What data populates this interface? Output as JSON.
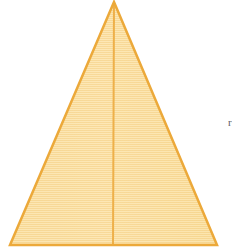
{
  "figure": {
    "background_color": "#ffffff",
    "canvas": {
      "width": 234,
      "height": 247
    },
    "shape": {
      "name": "triangle",
      "kind": "isosceles",
      "fill_color": "#fadf9f",
      "fill_color_light": "#fde9bb",
      "stroke_color": "#eca93a",
      "stroke_width": 2.5,
      "vertices": {
        "apex": {
          "x": 114,
          "y": 2
        },
        "base_left": {
          "x": 10,
          "y": 245
        },
        "base_right": {
          "x": 217,
          "y": 245
        }
      },
      "points_attr": "114,2 217,245 10,245"
    },
    "median": {
      "name": "median-line",
      "color": "#eeb04a",
      "width": 2,
      "from": {
        "x": 114,
        "y": 2
      },
      "to": {
        "x": 113,
        "y": 245
      }
    },
    "texture": {
      "type": "horizontal-scanlines",
      "period_px": 2,
      "line_color": "#f3d18a"
    },
    "edge_mark": {
      "name": "clipped-edge-glyph",
      "text": "r",
      "x": 228,
      "y": 122,
      "color": "#3a3a3a"
    }
  }
}
